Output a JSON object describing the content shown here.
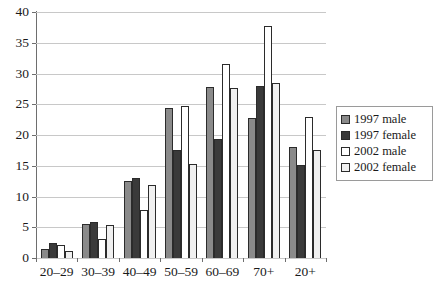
{
  "chart_data": {
    "type": "bar",
    "title": "",
    "xlabel": "",
    "ylabel": "",
    "ylim": [
      0,
      40
    ],
    "ytick_step": 5,
    "yticks": [
      "0",
      "5",
      "10",
      "15",
      "20",
      "25",
      "30",
      "35",
      "40"
    ],
    "grid": true,
    "legend_position": "right",
    "categories": [
      "20–29",
      "30–39",
      "40–49",
      "50–59",
      "60–69",
      "70+",
      "20+"
    ],
    "series": [
      {
        "name": "1997 male",
        "color": "#8a8a8a",
        "values": [
          1.5,
          5.6,
          12.5,
          24.4,
          27.8,
          22.8,
          18.0
        ]
      },
      {
        "name": "1997 female",
        "color": "#3a3a3a",
        "values": [
          2.4,
          5.8,
          13.0,
          17.6,
          19.4,
          28.0,
          15.2
        ]
      },
      {
        "name": "2002 male",
        "color": "#ffffff",
        "values": [
          2.1,
          3.1,
          7.8,
          24.7,
          31.5,
          37.7,
          22.9
        ]
      },
      {
        "name": "2002 female",
        "color": "#f0f0f0",
        "values": [
          1.2,
          5.4,
          11.8,
          15.3,
          27.6,
          28.4,
          17.5
        ]
      }
    ]
  },
  "legend": {
    "items": [
      {
        "label": "1997 male"
      },
      {
        "label": "1997 female"
      },
      {
        "label": "2002 male"
      },
      {
        "label": "2002 female"
      }
    ]
  }
}
